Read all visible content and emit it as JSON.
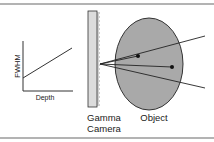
{
  "graph": {
    "ylabel": "FWHM",
    "xlabel": "Depth"
  },
  "camera": {
    "label_line1": "Gamma",
    "label_line2": "Camera"
  },
  "object": {
    "label": "Object"
  },
  "colors": {
    "frame": "#9a9a9a",
    "object_fill": "#a9a9a9",
    "camera_fill": "#dcdcdc",
    "line": "#222222"
  }
}
